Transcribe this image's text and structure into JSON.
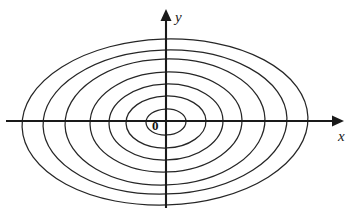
{
  "figure": {
    "background_color": "#ffffff",
    "stroke_color": "#262626",
    "axis_color": "#1a1a1a"
  },
  "axes": {
    "origin": {
      "x": 166,
      "y": 121
    },
    "x_axis": {
      "label": "x",
      "start": {
        "x": 6,
        "y": 121
      },
      "end": {
        "x": 338,
        "y": 121
      },
      "arrow": "right",
      "label_position": {
        "x": 338,
        "y": 129
      }
    },
    "y_axis": {
      "label": "y",
      "start": {
        "x": 166,
        "y": 208
      },
      "end": {
        "x": 166,
        "y": 12
      },
      "arrow": "up",
      "label_position": {
        "x": 175,
        "y": 10
      }
    },
    "origin_label": "0"
  },
  "chart_data": {
    "type": "line",
    "xlabel": "x",
    "ylabel": "y",
    "grid": false,
    "legend": null,
    "center": {
      "cx": 166,
      "cy": 122
    },
    "rotation_deg": -2,
    "series": [
      {
        "name": "ellipse-1",
        "rx": 20,
        "ry": 13
      },
      {
        "name": "ellipse-2",
        "rx": 40,
        "ry": 26
      },
      {
        "name": "ellipse-3",
        "rx": 57,
        "ry": 38
      },
      {
        "name": "ellipse-4",
        "rx": 76,
        "ry": 50
      },
      {
        "name": "ellipse-5",
        "rx": 100,
        "ry": 63
      },
      {
        "name": "ellipse-6",
        "rx": 122,
        "ry": 72
      },
      {
        "name": "ellipse-7",
        "rx": 143,
        "ry": 83
      }
    ],
    "x_axis_crossings_right": [
      184,
      203,
      219,
      237,
      263,
      285,
      308
    ],
    "x_axis_crossings_left": [
      146,
      126,
      109,
      90,
      66,
      44,
      23
    ],
    "annotations": [
      {
        "text": "0",
        "x": 155,
        "y": 126,
        "style": "bold"
      },
      {
        "text": "y",
        "x": 176,
        "y": 16,
        "style": "italic"
      },
      {
        "text": "x",
        "x": 340,
        "y": 136,
        "style": "italic"
      }
    ]
  }
}
